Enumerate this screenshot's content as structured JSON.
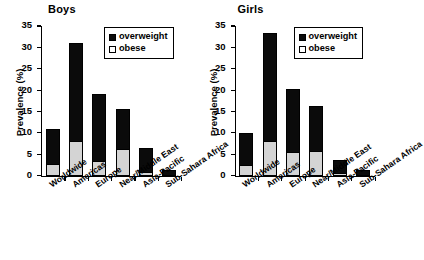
{
  "chart_data": [
    {
      "type": "bar",
      "title": "Boys",
      "xlabel": "",
      "ylabel": "Prevalence (%)",
      "ylim": [
        0,
        35
      ],
      "yticks": [
        0,
        5,
        10,
        15,
        20,
        25,
        30,
        35
      ],
      "grid": false,
      "stacked": true,
      "legend_position": "top-right",
      "categories": [
        "Worldwide",
        "Americas",
        "Europe",
        "Near/Middle East",
        "Asia-Pacific",
        "Sub-Sahara Africa"
      ],
      "series": [
        {
          "name": "obese",
          "values": [
            2.7,
            8.2,
            3.4,
            6.2,
            0.8,
            0.1
          ],
          "color": "#d4d4d4"
        },
        {
          "name": "overweight",
          "values": [
            8.3,
            22.8,
            15.8,
            9.5,
            5.7,
            1.2
          ],
          "color": "#0b0b0b"
        }
      ],
      "totals": [
        11.0,
        31.0,
        19.2,
        15.7,
        6.5,
        1.3
      ]
    },
    {
      "type": "bar",
      "title": "Girls",
      "xlabel": "",
      "ylabel": "Prevalence (%)",
      "ylim": [
        0,
        35
      ],
      "yticks": [
        0,
        5,
        10,
        15,
        20,
        25,
        30,
        35
      ],
      "grid": false,
      "stacked": true,
      "legend_position": "top-right",
      "categories": [
        "Worldwide",
        "Americas",
        "Europe",
        "Near/Middle East",
        "Asia-Pacific",
        "Sub-Sahara Africa"
      ],
      "series": [
        {
          "name": "obese",
          "values": [
            2.5,
            8.0,
            5.5,
            5.8,
            0.5,
            0.1
          ],
          "color": "#d4d4d4"
        },
        {
          "name": "overweight",
          "values": [
            7.5,
            25.4,
            14.7,
            10.6,
            3.1,
            1.2
          ],
          "color": "#0b0b0b"
        }
      ],
      "totals": [
        10.0,
        33.4,
        20.2,
        16.4,
        3.6,
        1.3
      ]
    }
  ],
  "legend": {
    "overweight_label": "overweight",
    "obese_label": "obese"
  },
  "colors": {
    "overweight": "#0b0b0b",
    "obese": "#d4d4d4",
    "axis": "#000000",
    "background": "#ffffff"
  }
}
